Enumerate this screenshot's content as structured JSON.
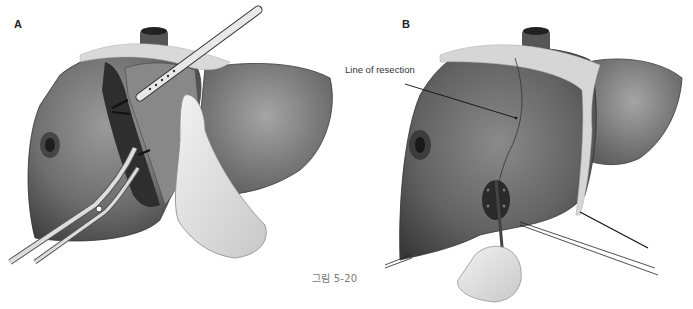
{
  "figure": {
    "caption": "그림 5-20",
    "panels": [
      {
        "label": "A",
        "description": "Right hepatectomy parenchymal transection: liver with retracted right lobe, instrument probe and curved clamp, gloved hand"
      },
      {
        "label": "B",
        "description": "Liver with marked line of resection, sutured vessels at hilum, forceps and ligature threads"
      }
    ],
    "annotations": [
      {
        "panel": "B",
        "text": "Line of resection"
      }
    ],
    "colors": {
      "liver_dark": "#4a4a4a",
      "liver_mid": "#7a7a7a",
      "liver_light": "#a8a8a8",
      "cut_surface": "#2e2e2e",
      "glove": "#e6e6e6",
      "instrument": "#d8d8d8",
      "caption_text": "#777777"
    }
  }
}
